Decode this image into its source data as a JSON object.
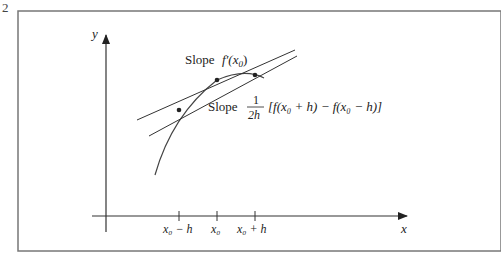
{
  "figure_number_fragment": "2",
  "axes": {
    "x_label": "x",
    "y_label": "y"
  },
  "annotations": {
    "slope_tangent_prefix": "Slope",
    "slope_tangent_expr": "f′(x",
    "slope_tangent_sub": "0",
    "slope_tangent_close": ")",
    "slope_secant_prefix": "Slope",
    "slope_secant_frac_num": "1",
    "slope_secant_frac_den": "2h",
    "slope_secant_expr": "[f(x₀ + h) − f(x₀ − h)]"
  },
  "ticks": [
    {
      "label": "x₀ − h"
    },
    {
      "label": "x₀"
    },
    {
      "label": "x₀ + h"
    }
  ],
  "colors": {
    "frame": "#777777",
    "lines": "#333333"
  }
}
